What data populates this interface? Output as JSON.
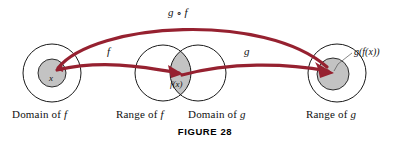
{
  "figure": {
    "caption": "FIGURE 28",
    "colors": {
      "arrow": "#962130",
      "circle_stroke": "#1a1a1a",
      "shaded_fill": "#c3c3c3",
      "text": "#111111",
      "background": "#ffffff"
    }
  },
  "set_labels": [
    {
      "id": "domain-of-f",
      "prefix": "Domain of ",
      "symbol": "f"
    },
    {
      "id": "range-of-f",
      "prefix": "Range of ",
      "symbol": "f"
    },
    {
      "id": "domain-of-g",
      "prefix": "Domain of ",
      "symbol": "g"
    },
    {
      "id": "range-of-g",
      "prefix": "Range of ",
      "symbol": "g"
    }
  ],
  "point_labels": {
    "x": "x",
    "fx": "f(x)",
    "gfx": "g(f(x))"
  },
  "map_labels": {
    "f": "f",
    "g": "g",
    "composite_left": "g",
    "composite_op": " ∘ ",
    "composite_right": "f"
  },
  "diagram_data": {
    "type": "diagram",
    "description": "Function composition mapping diagram",
    "circles": [
      {
        "name": "domain-of-f-outer",
        "cx": 52,
        "cy": 73,
        "r": 29,
        "fill": "none"
      },
      {
        "name": "domain-of-f-element",
        "cx": 52,
        "cy": 73,
        "r": 14,
        "fill": "#c3c3c3"
      },
      {
        "name": "range-of-f-outer",
        "cx": 163,
        "cy": 73,
        "r": 28,
        "fill": "none"
      },
      {
        "name": "domain-of-g-outer",
        "cx": 198,
        "cy": 73,
        "r": 28,
        "fill": "none"
      },
      {
        "name": "range-of-g-outer",
        "cx": 337,
        "cy": 73,
        "r": 29,
        "fill": "none"
      },
      {
        "name": "range-of-g-element",
        "cx": 333,
        "cy": 74,
        "r": 16,
        "fill": "#c3c3c3"
      }
    ],
    "arrows": [
      {
        "name": "f-arrow",
        "from": [
          57,
          70
        ],
        "to": [
          181,
          74
        ],
        "label": "f"
      },
      {
        "name": "g-arrow",
        "from": [
          181,
          74
        ],
        "to": [
          331,
          73
        ],
        "label": "g"
      },
      {
        "name": "composite-arrow",
        "from": [
          57,
          68
        ],
        "to": [
          330,
          70
        ],
        "label": "g ∘ f"
      }
    ]
  }
}
